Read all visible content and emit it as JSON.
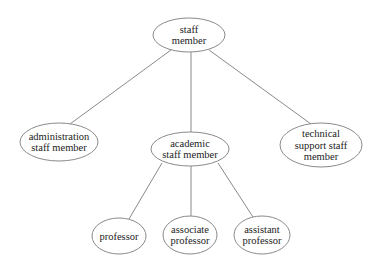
{
  "diagram": {
    "type": "hierarchy-tree",
    "nodes": {
      "staff_member": {
        "lines": [
          "staff",
          "member"
        ],
        "cx": 189,
        "cy": 35,
        "rx": 36,
        "ry": 17
      },
      "administration_staff_member": {
        "lines": [
          "administration",
          "staff member"
        ],
        "cx": 59,
        "cy": 142,
        "rx": 39,
        "ry": 19
      },
      "academic_staff_member": {
        "lines": [
          "academic",
          "staff member"
        ],
        "cx": 190,
        "cy": 149,
        "rx": 39,
        "ry": 17
      },
      "technical_support_staff_member": {
        "lines": [
          "technical",
          "support staff",
          "member"
        ],
        "cx": 321,
        "cy": 145,
        "rx": 41,
        "ry": 22
      },
      "professor": {
        "lines": [
          "professor"
        ],
        "cx": 119,
        "cy": 236,
        "rx": 27,
        "ry": 18
      },
      "associate_professor": {
        "lines": [
          "associate",
          "professor"
        ],
        "cx": 190,
        "cy": 235,
        "rx": 27,
        "ry": 19
      },
      "assistant_professor": {
        "lines": [
          "assistant",
          "professor"
        ],
        "cx": 262,
        "cy": 235,
        "rx": 28,
        "ry": 19
      }
    },
    "edges": [
      {
        "from": "staff_member",
        "to": "administration_staff_member",
        "x1": 171,
        "y1": 50,
        "x2": 70,
        "y2": 124
      },
      {
        "from": "staff_member",
        "to": "academic_staff_member",
        "x1": 191,
        "y1": 52,
        "x2": 191,
        "y2": 132
      },
      {
        "from": "staff_member",
        "to": "technical_support_staff_member",
        "x1": 209,
        "y1": 50,
        "x2": 311,
        "y2": 124
      },
      {
        "from": "academic_staff_member",
        "to": "professor",
        "x1": 162,
        "y1": 163,
        "x2": 129,
        "y2": 219
      },
      {
        "from": "academic_staff_member",
        "to": "associate_professor",
        "x1": 191,
        "y1": 166,
        "x2": 191,
        "y2": 216
      },
      {
        "from": "academic_staff_member",
        "to": "assistant_professor",
        "x1": 218,
        "y1": 163,
        "x2": 253,
        "y2": 217
      }
    ]
  }
}
